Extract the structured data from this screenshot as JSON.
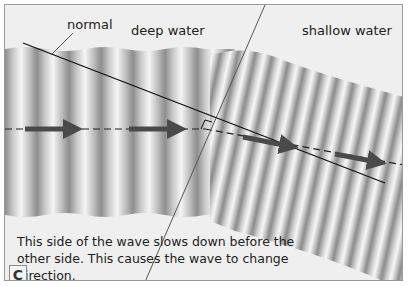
{
  "diagram": {
    "panel_label": "C",
    "labels": {
      "normal": "normal",
      "deep_water": "deep water",
      "shallow_water": "shallow water"
    },
    "caption": {
      "line1": "This side of the wave slows down before the",
      "line2": "other side. This causes the wave to change direction."
    },
    "colors": {
      "background": "#efefef",
      "border": "#9a9a9a",
      "wave_light": "#f4f4f4",
      "wave_dark": "#8c8c8c",
      "arrow": "#555555",
      "line": "#111111"
    },
    "elements": {
      "deep_region_wavelength_px": 32,
      "shallow_region_wavelength_px": 17,
      "arrows_deep": 2,
      "arrows_shallow": 2
    }
  }
}
